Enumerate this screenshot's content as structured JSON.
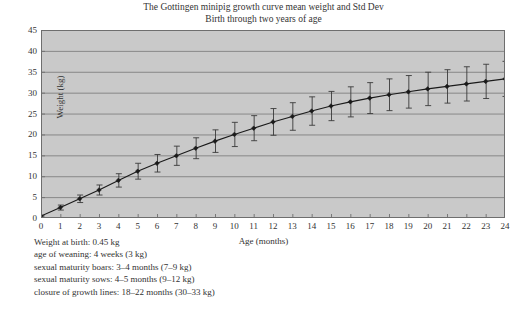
{
  "title": {
    "line1": "The Gottingen minipig growth curve mean weight and Std Dev",
    "line2": "Birth through two years of age"
  },
  "axes": {
    "xlabel": "Age (months)",
    "ylabel": "Weight (kg)"
  },
  "caption": {
    "lines": [
      "Weight at birth: 0.45 kg",
      "age of weaning: 4 weeks (3 kg)",
      "sexual maturity boars: 3–4 months (7–9 kg)",
      "sexual maturity sows:  4–5 months (9–12 kg)",
      "closure of growth lines: 18–22 months (30–33 kg)"
    ]
  },
  "colors": {
    "plot_background": "#c9c9c9",
    "gridline": "#808080",
    "axis_border": "#6e6e6e",
    "series_line": "#1a1a1a",
    "marker": "#1a1a1a",
    "error_bar": "#3a3a3a",
    "text": "#333333",
    "page_background": "#ffffff"
  },
  "chart_data": {
    "type": "line",
    "xlabel": "Age (months)",
    "ylabel": "Weight (kg)",
    "xlim": [
      0,
      24
    ],
    "ylim": [
      0,
      45
    ],
    "xticks": [
      0,
      1,
      2,
      3,
      4,
      5,
      6,
      7,
      8,
      9,
      10,
      11,
      12,
      13,
      14,
      15,
      16,
      17,
      18,
      19,
      20,
      21,
      22,
      23,
      24
    ],
    "yticks": [
      0,
      5,
      10,
      15,
      20,
      25,
      30,
      35,
      40,
      45
    ],
    "grid": "horizontal",
    "legend": "none",
    "marker": "diamond",
    "errorbars": "std-dev",
    "x": [
      0,
      1,
      2,
      3,
      4,
      5,
      6,
      7,
      8,
      9,
      10,
      11,
      12,
      13,
      14,
      15,
      16,
      17,
      18,
      19,
      20,
      21,
      22,
      23,
      24
    ],
    "series": [
      {
        "name": "mean weight",
        "values": [
          0.45,
          2.5,
          4.6,
          6.7,
          9.0,
          11.2,
          13.1,
          14.9,
          16.7,
          18.4,
          20.0,
          21.5,
          23.0,
          24.3,
          25.6,
          26.8,
          27.8,
          28.7,
          29.5,
          30.2,
          30.9,
          31.5,
          32.1,
          32.7,
          33.3
        ],
        "errors": [
          0.2,
          0.6,
          0.9,
          1.2,
          1.6,
          1.9,
          2.1,
          2.3,
          2.5,
          2.7,
          2.9,
          3.0,
          3.2,
          3.3,
          3.4,
          3.5,
          3.6,
          3.7,
          3.8,
          3.9,
          4.0,
          4.0,
          4.1,
          4.1,
          4.2
        ]
      }
    ]
  }
}
